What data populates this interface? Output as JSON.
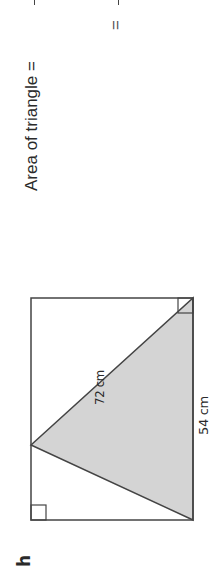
{
  "question": {
    "letter": "h",
    "dimensions": {
      "top": "54 cm",
      "side": "72 cm"
    },
    "area_label": "Area of triangle =",
    "continuation_equals": "="
  },
  "figure": {
    "rectangle": {
      "x": 55,
      "y": 31,
      "width": 222,
      "height": 162
    },
    "triangle_points": "55,193 130,31 277,193",
    "fill_color": "#d4d4d4",
    "stroke_color": "#444444"
  }
}
